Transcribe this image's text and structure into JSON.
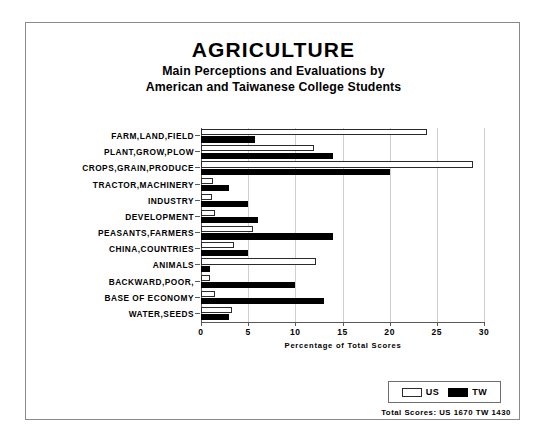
{
  "frame": {
    "border_color": "#8a8a8a"
  },
  "title": {
    "main": "AGRICULTURE",
    "sub_line_1": "Main Perceptions and Evaluations by",
    "sub_line_2": "American and Taiwanese College Students"
  },
  "legend": {
    "us_label": "US",
    "tw_label": "TW",
    "us_color": "#ffffff",
    "tw_color": "#000000"
  },
  "footnote": "Total Scores:  US 1670   TW 1430",
  "chart_data": {
    "type": "bar",
    "orientation": "horizontal",
    "title": "AGRICULTURE",
    "subtitle": "Main Perceptions and Evaluations by American and Taiwanese College Students",
    "xlabel": "Percentage of Total Scores",
    "ylabel": "",
    "xlim": [
      0,
      30
    ],
    "xticks": [
      0,
      5,
      10,
      15,
      20,
      25,
      30
    ],
    "xticklabels": [
      "0",
      "5",
      "10",
      "15",
      "20",
      "25",
      "30"
    ],
    "grid": true,
    "legend_position": "bottom-right",
    "categories": [
      "FARM,LAND,FIELD",
      "PLANT,GROW,PLOW",
      "CROPS,GRAIN,PRODUCE",
      "TRACTOR,MACHINERY",
      "INDUSTRY",
      "DEVELOPMENT",
      "PEASANTS,FARMERS",
      "CHINA,COUNTRIES",
      "ANIMALS",
      "BACKWARD,POOR,",
      "BASE OF ECONOMY",
      "WATER,SEEDS"
    ],
    "series": [
      {
        "name": "US",
        "color": "#ffffff",
        "values": [
          24.0,
          12.0,
          28.8,
          1.3,
          1.2,
          1.5,
          5.5,
          3.5,
          12.2,
          1.0,
          1.5,
          3.3
        ]
      },
      {
        "name": "TW",
        "color": "#000000",
        "values": [
          5.7,
          14.0,
          20.0,
          3.0,
          5.0,
          6.0,
          14.0,
          5.0,
          1.0,
          10.0,
          13.0,
          3.0
        ]
      }
    ],
    "annotations": [
      "Total Scores:  US 1670   TW 1430"
    ]
  }
}
